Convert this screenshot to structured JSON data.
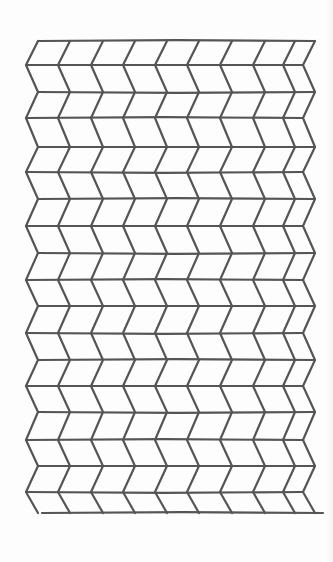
{
  "drawing": {
    "title": "Hand-drawn chevron (zig-zag) tessellation grid",
    "stroke_color": "#555555",
    "stroke_width": 2.2,
    "background_color": "#fdfdfd",
    "columns": 9,
    "rows": 18,
    "row_lines_y": [
      41,
      65,
      92,
      118,
      147,
      172,
      199,
      226,
      253,
      280,
      306,
      333,
      360,
      386,
      412,
      440,
      466,
      492,
      513
    ],
    "column_x_at_even_lines": [
      38,
      70,
      103,
      135,
      167,
      199,
      232,
      265,
      295,
      315
    ],
    "zig_offset": -12
  }
}
